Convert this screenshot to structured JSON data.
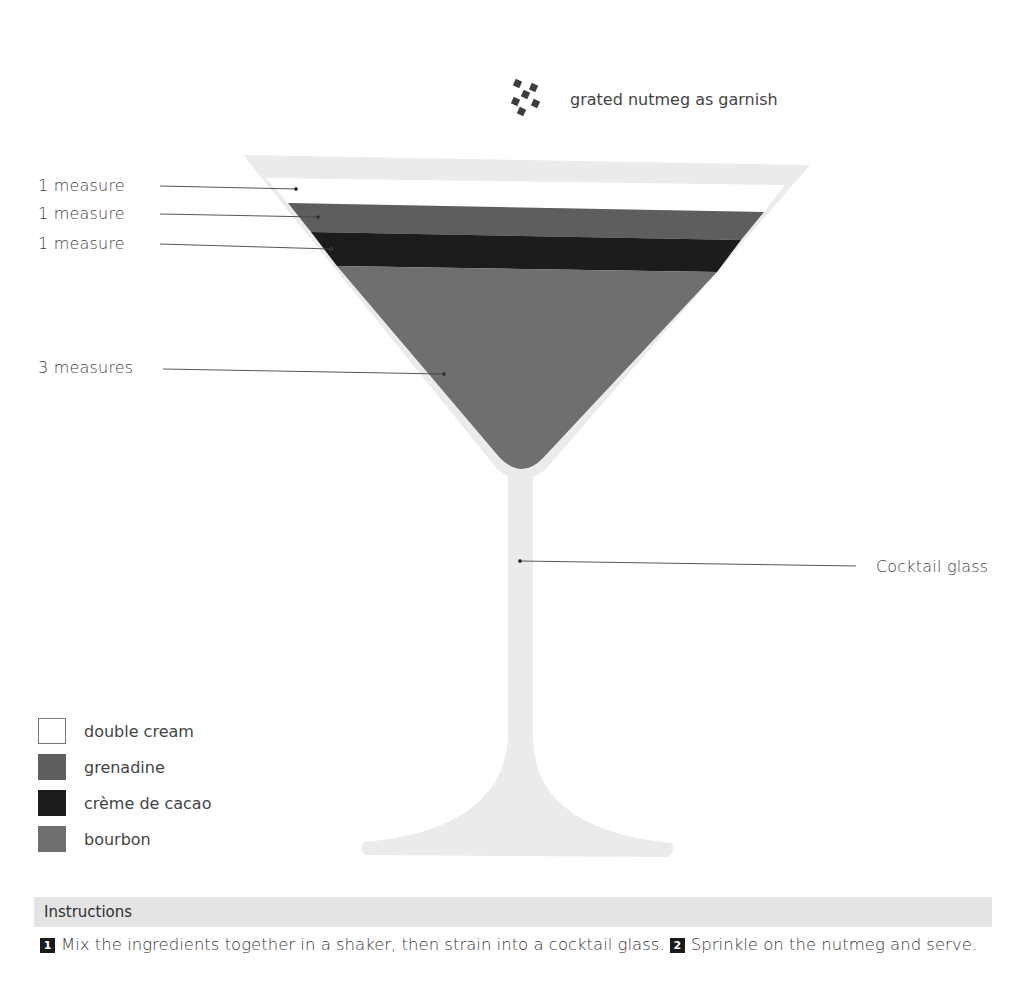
{
  "garnish": {
    "icon": "nutmeg-flakes-icon",
    "label": "grated nutmeg as garnish"
  },
  "layers": [
    {
      "measure": "1 measure",
      "ingredient": "double cream",
      "color": "#ffffff"
    },
    {
      "measure": "1 measure",
      "ingredient": "grenadine",
      "color": "#5e5e5e"
    },
    {
      "measure": "1 measure",
      "ingredient": "crème de cacao",
      "color": "#1c1c1c"
    },
    {
      "measure": "3 measures",
      "ingredient": "bourbon",
      "color": "#6f6f6f"
    }
  ],
  "glass": {
    "label": "Cocktail glass",
    "color": "#ebebeb"
  },
  "legend": [
    {
      "label": "double cream",
      "color": "#ffffff"
    },
    {
      "label": "grenadine",
      "color": "#5e5e5e"
    },
    {
      "label": "crème de cacao",
      "color": "#1c1c1c"
    },
    {
      "label": "bourbon",
      "color": "#6f6f6f"
    }
  ],
  "instructions": {
    "title": "Instructions",
    "steps": [
      {
        "number": "1",
        "text": "Mix the ingredients together in a shaker, then strain into a cocktail glass."
      },
      {
        "number": "2",
        "text": "Sprinkle on the nutmeg and serve."
      }
    ]
  }
}
